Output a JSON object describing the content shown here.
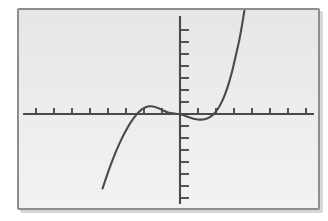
{
  "device": {
    "name": "graphing-calculator-screen",
    "bezel_color": "#8d8d8d",
    "screen_background": "#ececec",
    "ink_color": "#4a4a4a"
  },
  "chart_data": {
    "type": "line",
    "title": "",
    "subtitle": "",
    "xlabel": "",
    "ylabel": "",
    "grid": false,
    "legend": null,
    "axis_style": "centered-crosshair-with-tick-marks",
    "xlim": [
      -9.4,
      9.4
    ],
    "ylim": [
      -6.2,
      6.2
    ],
    "xtick_step": 1,
    "ytick_step": 1,
    "tick_labels_visible": false,
    "features": {
      "local_maximum": {
        "x": -1.7,
        "y": 0.65
      },
      "local_minimum": {
        "x": 1.4,
        "y": -0.45
      },
      "x_intercepts": [
        -2.9,
        -0.1,
        2.5
      ],
      "y_intercept": 0.05,
      "enters_screen_at": {
        "x": -4.3,
        "y": -6.2
      },
      "exits_screen_at": {
        "x": 3.9,
        "y": 6.2
      }
    },
    "series": [
      {
        "name": "y1",
        "color": "#4a4a4a",
        "x": [
          -4.3,
          -4.1,
          -3.9,
          -3.7,
          -3.5,
          -3.3,
          -3.1,
          -2.9,
          -2.7,
          -2.5,
          -2.3,
          -2.1,
          -1.9,
          -1.7,
          -1.5,
          -1.3,
          -1.1,
          -0.9,
          -0.7,
          -0.5,
          -0.3,
          -0.1,
          0.1,
          0.3,
          0.5,
          0.7,
          0.9,
          1.1,
          1.3,
          1.5,
          1.7,
          1.9,
          2.1,
          2.3,
          2.5,
          2.7,
          2.9,
          3.1,
          3.3,
          3.5,
          3.7,
          3.9
        ],
        "y": [
          -6.2,
          -5.3,
          -4.45,
          -3.66,
          -2.93,
          -2.26,
          -1.65,
          -1.1,
          -0.62,
          -0.2,
          0.14,
          0.41,
          0.57,
          0.64,
          0.62,
          0.54,
          0.42,
          0.27,
          0.15,
          0.08,
          0.04,
          0.0,
          -0.06,
          -0.16,
          -0.27,
          -0.37,
          -0.44,
          -0.47,
          -0.46,
          -0.38,
          -0.22,
          0.04,
          0.42,
          0.95,
          1.64,
          2.51,
          3.58,
          4.86,
          6.2,
          7.9,
          9.9,
          12.2
        ]
      }
    ]
  }
}
